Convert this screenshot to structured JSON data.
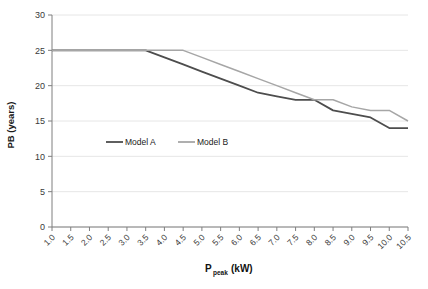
{
  "chart_data": {
    "type": "line",
    "title": "",
    "subtitle": "",
    "xlabel": "P_peak (kW)",
    "xlabel_main": "P",
    "xlabel_subscript": "peak",
    "xlabel_units": "(kW)",
    "ylabel": "PB (years)",
    "xlim": [
      1.0,
      10.5
    ],
    "ylim": [
      0,
      30
    ],
    "grid": "horizontal",
    "legend_position": "inside-center-left",
    "x": [
      1.0,
      1.5,
      2.0,
      2.5,
      3.0,
      3.5,
      4.0,
      4.5,
      5.0,
      5.5,
      6.0,
      6.5,
      7.0,
      7.5,
      8.0,
      8.5,
      9.0,
      9.5,
      10.0,
      10.5
    ],
    "xticklabels": [
      "1.0",
      "1.5",
      "2.0",
      "2.5",
      "3.0",
      "3.5",
      "4.0",
      "4.5",
      "5.0",
      "5.5",
      "6.0",
      "6.5",
      "7.0",
      "7.5",
      "8.0",
      "8.5",
      "9.0",
      "9.5",
      "10.0",
      "10.5"
    ],
    "yticks": [
      0,
      5,
      10,
      15,
      20,
      25,
      30
    ],
    "yticklabels": [
      "0",
      "5",
      "10",
      "15",
      "20",
      "25",
      "30"
    ],
    "series": [
      {
        "name": "Model A",
        "color": "#4d4d4d",
        "width": 1.8,
        "values": [
          25,
          25,
          25,
          25,
          25,
          25,
          24,
          23,
          22,
          21,
          20,
          19,
          18.5,
          18,
          18,
          16.5,
          16,
          15.5,
          14,
          14
        ]
      },
      {
        "name": "Model B",
        "color": "#a6a6a6",
        "width": 1.5,
        "values": [
          25,
          25,
          25,
          25,
          25,
          25,
          25,
          25,
          24,
          23,
          22,
          21,
          20,
          19,
          18,
          18,
          17,
          16.5,
          16.5,
          15
        ]
      }
    ]
  },
  "legend": {
    "items": [
      {
        "label": "Model A",
        "color": "#4d4d4d"
      },
      {
        "label": "Model B",
        "color": "#a6a6a6"
      }
    ]
  },
  "colors": {
    "axis": "#7f7f7f",
    "grid": "#e6e6e6",
    "text": "#2b2b2b",
    "background": "#ffffff"
  }
}
